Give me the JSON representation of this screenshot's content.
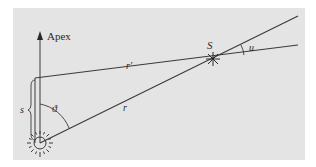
{
  "diagram": {
    "background_color": "#e4e4e4",
    "line_color": "#3a3a3a",
    "labels": {
      "apex": "Apex",
      "star": "S",
      "r_prime": "r′",
      "r": "r",
      "s": "s",
      "theta": "ϑ",
      "u": "u"
    },
    "elements": {
      "sun": "Sun (origin)",
      "star_point": "Star S",
      "apex_direction": "Direction of apex",
      "line_r": "Sun-to-star distance r",
      "line_r_prime": "Shifted observer-to-star distance r′",
      "angle_theta": "Angle between apex and r",
      "angle_u": "Parallactic shift angle u",
      "displacement_s": "Displacement s toward apex"
    }
  }
}
